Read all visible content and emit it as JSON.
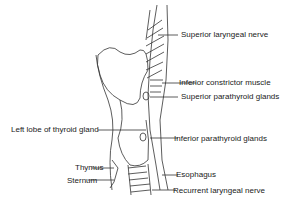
{
  "diagram": {
    "labels": {
      "superior_laryngeal_nerve": "Superior laryngeal nerve",
      "inferior_constrictor_muscle": "Inferior constrictor muscle",
      "superior_parathyroid_glands": "Superior parathyroid glands",
      "left_lobe_thyroid": "Left lobe of thyroid gland",
      "inferior_parathyroid_glands": "Inferior parathyroid glands",
      "thymus": "Thymus",
      "esophagus": "Esophagus",
      "sternum": "Sternum",
      "recurrent_laryngeal_nerve": "Recurrent laryngeal nerve"
    },
    "colors": {
      "line": "#333333",
      "text": "#222222",
      "background": "#ffffff"
    }
  }
}
